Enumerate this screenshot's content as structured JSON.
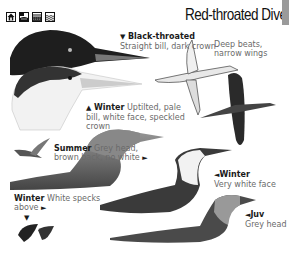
{
  "header": {
    "title": "Red-throated Diver",
    "habitat_icons": [
      "house-habitat-icon",
      "coast-habitat-icon",
      "marsh-habitat-icon",
      "sea-habitat-icon"
    ]
  },
  "annotations": {
    "black_throated": {
      "marker": "▼",
      "label": "Black-throated",
      "text": "Straight bill, dark crown"
    },
    "flight": {
      "text_line1": "Deep beats,",
      "text_line2": "narrow wings"
    },
    "winter_head": {
      "marker": "▲",
      "label": "Winter",
      "text_line1": " Uptilted, pale",
      "text_line2": "bill, white face, speckled",
      "text_line3": "crown"
    },
    "summer": {
      "label": "Summer",
      "text_line1": " Grey head,",
      "text_line2": "brown back, no white",
      "marker": "►"
    },
    "winter_body": {
      "marker": "◄",
      "label": "Winter",
      "text": "Very white face"
    },
    "winter_specks": {
      "label": "Winter",
      "text_line1": " White specks",
      "text_line2": "above",
      "marker_right": "►",
      "marker_down": "▼"
    },
    "juv": {
      "marker": "◄",
      "label": "Juv",
      "text": "Grey head"
    }
  },
  "colors": {
    "title": "#111111",
    "label": "#1a1a1a",
    "body_text": "#6a6a6a",
    "tab": "#9a9a9a"
  }
}
